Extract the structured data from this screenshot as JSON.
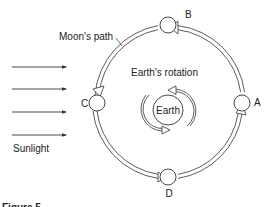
{
  "diagram": {
    "labels": {
      "moons_path": "Moon's path",
      "earths_rotation": "Earth's rotation",
      "earth": "Earth",
      "sunlight": "Sunlight"
    },
    "moon_positions": [
      {
        "id": "A",
        "label": "A"
      },
      {
        "id": "B",
        "label": "B"
      },
      {
        "id": "C",
        "label": "C"
      },
      {
        "id": "D",
        "label": "D"
      }
    ],
    "sunlight_arrow_count": 4,
    "caption": "Figure 5",
    "colors": {
      "line": "#333333",
      "background": "#ffffff"
    }
  }
}
